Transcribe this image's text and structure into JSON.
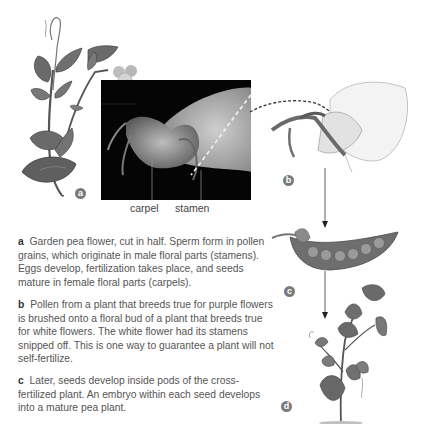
{
  "figure": {
    "panels": [
      {
        "id": "a",
        "label": "a",
        "caption_letter": "a",
        "caption": "Garden pea flower, cut in half. Sperm form in pollen grains, which originate in male floral parts (stamens). Eggs develop, fertilization takes place, and seeds mature in female floral parts (carpels)."
      },
      {
        "id": "b",
        "label": "b",
        "caption_letter": "b",
        "caption": "Pollen from a plant that breeds true for purple flowers is brushed onto a floral bud of a plant that breeds true for white flowers. The white flower had its stamens snipped off. This is one way to guarantee a plant will not self-fertilize."
      },
      {
        "id": "c",
        "label": "c",
        "caption_letter": "c",
        "caption": "Later, seeds develop inside pods of the cross-fertilized plant. An embryo within each seed develops into a mature pea plant."
      },
      {
        "id": "d",
        "label": "d"
      }
    ],
    "photo_labels": {
      "carpel": "carpel",
      "stamen": "stamen"
    },
    "colors": {
      "photo_bg": "#050505",
      "label_circle": "#7a7a7a",
      "leaf_dark": "#5d5d5d",
      "leaf_mid": "#8a8a8a",
      "petal": "#e6e6e6",
      "caption_text": "#555555"
    }
  }
}
